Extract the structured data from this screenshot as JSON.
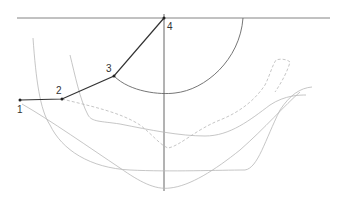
{
  "diagram": {
    "colors": {
      "background": "#ffffff",
      "polyline": "#333333",
      "axis": "#555555",
      "arc": "#666666",
      "curve": "#b0b0b0"
    },
    "points": [
      {
        "label": "1",
        "x": 20,
        "y": 100
      },
      {
        "label": "2",
        "x": 62,
        "y": 99
      },
      {
        "label": "3",
        "x": 114,
        "y": 76
      },
      {
        "label": "4",
        "x": 164,
        "y": 18
      }
    ],
    "labels": {
      "p1": "1",
      "p2": "2",
      "p3": "3",
      "p4": "4"
    }
  }
}
